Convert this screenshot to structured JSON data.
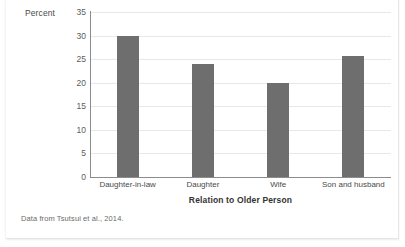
{
  "figure": {
    "source_note": "Data from Tsutsui et al., 2014."
  },
  "chart_data": {
    "type": "bar",
    "title": "",
    "xlabel": "Relation to Older Person",
    "ylabel": "Percent",
    "categories": [
      "Daughter-in-law",
      "Daughter",
      "Wife",
      "Son and husband"
    ],
    "values": [
      29.9,
      23.9,
      19.9,
      25.7
    ],
    "ylim": [
      0,
      35
    ],
    "yticks": [
      0,
      5,
      10,
      15,
      20,
      25,
      30,
      35
    ],
    "ytick_labels": [
      "0",
      "5",
      "10",
      "15",
      "20",
      "25",
      "30",
      "35"
    ],
    "grid": true,
    "legend": null,
    "bar_color": "#6e6e6e",
    "gridline_color": "#e8e8e8",
    "axis_color": "#8c8c8c"
  }
}
